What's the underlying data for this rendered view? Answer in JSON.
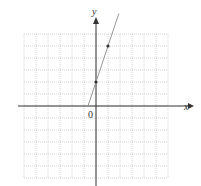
{
  "chart_data": {
    "type": "line",
    "title": "",
    "xlabel": "x",
    "ylabel": "y",
    "origin_label": "0",
    "grid": true,
    "xlim": [
      -6,
      6
    ],
    "ylim": [
      -6,
      6
    ],
    "series": [
      {
        "name": "y = 3x + 2",
        "slope": 3,
        "intercept": 2,
        "x": [
          -0.67,
          1.9
        ],
        "y": [
          0,
          7.7
        ]
      }
    ],
    "points": [
      {
        "x": 0,
        "y": 2
      },
      {
        "x": 1,
        "y": 5
      }
    ]
  }
}
